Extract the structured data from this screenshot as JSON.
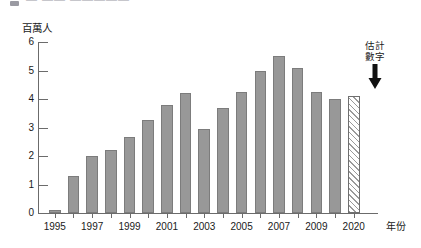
{
  "header": {
    "bullet_icon": "square-bullet-icon",
    "cutoff_title": "— —— —————"
  },
  "chart_data": {
    "type": "bar",
    "title": "",
    "ylabel": "百萬人",
    "xlabel": "年份",
    "ylim": [
      0,
      6
    ],
    "yticks": [
      0,
      1,
      2,
      3,
      4,
      5,
      6
    ],
    "grid": false,
    "legend": false,
    "categories": [
      "1995",
      "1996",
      "1997",
      "1998",
      "1999",
      "2000",
      "2001",
      "2002",
      "2003",
      "2004",
      "2005",
      "2006",
      "2007",
      "2008",
      "2009",
      "2010",
      "2020"
    ],
    "xtick_labels": [
      "1995",
      "1997",
      "1999",
      "2001",
      "2003",
      "2005",
      "2007",
      "2009",
      "2020"
    ],
    "values": [
      0.1,
      1.3,
      2.0,
      2.2,
      2.65,
      3.25,
      3.8,
      4.2,
      2.95,
      3.7,
      4.25,
      5.0,
      5.5,
      5.1,
      4.25,
      4.0,
      4.1
    ],
    "series": [
      {
        "name": "人數",
        "values": [
          0.1,
          1.3,
          2.0,
          2.2,
          2.65,
          3.25,
          3.8,
          4.2,
          2.95,
          3.7,
          4.25,
          5.0,
          5.5,
          5.1,
          4.25,
          4.0,
          4.1
        ]
      }
    ],
    "estimated_category": "2020",
    "annotation": {
      "line1": "估計",
      "line2": "數字",
      "target": "2020",
      "arrow_icon": "down-arrow-icon"
    },
    "colors": {
      "bar_fill": "#989898",
      "bar_stroke": "#7c7c7c",
      "estimate_hatch": "#9a9a9a",
      "axis": "#6b6b6b",
      "text": "#1a1a1a"
    }
  }
}
